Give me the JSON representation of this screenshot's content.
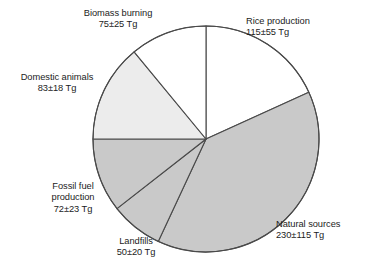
{
  "chart_data": {
    "type": "pie",
    "title": "",
    "subtitle": "",
    "xlabel": "",
    "ylabel": "",
    "unit": "Tg",
    "legend_position": "none",
    "grid": false,
    "start_angle_deg": 0,
    "direction": "clockwise",
    "center": {
      "x": 206,
      "y": 139,
      "radius": 113
    },
    "categories": [
      "Rice production",
      "Natural sources",
      "Landfills",
      "Fossil fuel production",
      "Domestic animals",
      "Biomass burning"
    ],
    "values": [
      115,
      230,
      50,
      72,
      83,
      75
    ],
    "errors": [
      55,
      115,
      20,
      23,
      18,
      25
    ],
    "value_labels": [
      "115±55 Tg",
      "230±115 Tg",
      "50±20 Tg",
      "72±23 Tg",
      "83±18 Tg",
      "75±25 Tg"
    ],
    "slice_colors": [
      "#ffffff",
      "#c9c9c9",
      "#c9c9c9",
      "#c9c9c9",
      "#ececec",
      "#ffffff"
    ],
    "slice_angles_deg": [
      {
        "start": 0,
        "end": 65.5
      },
      {
        "start": 65.5,
        "end": 205.0
      },
      {
        "start": 205.0,
        "end": 232.0
      },
      {
        "start": 232.0,
        "end": 270.0
      },
      {
        "start": 270.0,
        "end": 320.5
      },
      {
        "start": 320.5,
        "end": 360.0
      }
    ],
    "outline_color": "#4a4a4a",
    "background_color": "#ffffff"
  },
  "labels": {
    "rice": {
      "name": "Rice production",
      "value": "115±55 Tg"
    },
    "natural": {
      "name": "Natural sources",
      "value": "230±115 Tg"
    },
    "landfills": {
      "name": "Landfills",
      "value": "50±20 Tg"
    },
    "fossil": {
      "name": "Fossil fuel",
      "name2": "production",
      "value": "72±23 Tg"
    },
    "domestic": {
      "name": "Domestic animals",
      "value": "83±18 Tg"
    },
    "biomass": {
      "name": "Biomass burning",
      "value": "75±25 Tg"
    }
  }
}
